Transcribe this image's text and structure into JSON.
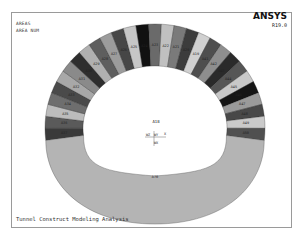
{
  "header": {
    "line1": "AREAS",
    "line2": "AREA NUM"
  },
  "logo": {
    "name": "ANSYS",
    "version": "R19.0"
  },
  "footer": {
    "title": "Tunnel Construct Modeling Analysis"
  },
  "plot": {
    "center_label": "A18",
    "triad": {
      "z": "WZ",
      "y": "WY",
      "x": "X",
      "wx": "WX"
    },
    "invert_label": "A70",
    "segments": [
      {
        "label": "A37",
        "color": "#3a3a3a"
      },
      {
        "label": "A36",
        "color": "#5a5a5a"
      },
      {
        "label": "A35",
        "color": "#bcbcbc"
      },
      {
        "label": "A34",
        "color": "#6e6e6e"
      },
      {
        "label": "A33",
        "color": "#4a4a4a"
      },
      {
        "label": "A32",
        "color": "#a8a8a8"
      },
      {
        "label": "A31",
        "color": "#8a8a8a"
      },
      {
        "label": "A30",
        "color": "#2e2e2e"
      },
      {
        "label": "A29",
        "color": "#b0b0b0"
      },
      {
        "label": "A28",
        "color": "#5e5e5e"
      },
      {
        "label": "A27",
        "color": "#9c9c9c"
      },
      {
        "label": "A26",
        "color": "#464646"
      },
      {
        "label": "A25",
        "color": "#c6c6c6"
      },
      {
        "label": "A24",
        "color": "#111111"
      },
      {
        "label": "A23",
        "color": "#6a6a6a"
      },
      {
        "label": "A22",
        "color": "#c0c0c0"
      },
      {
        "label": "A21",
        "color": "#7a7a7a"
      },
      {
        "label": "A20",
        "color": "#3c3c3c"
      },
      {
        "label": "A19",
        "color": "#d0d0d0"
      },
      {
        "label": "A41",
        "color": "#4e4e4e"
      },
      {
        "label": "A42",
        "color": "#8e8e8e"
      },
      {
        "label": "A43",
        "color": "#2a2a2a"
      },
      {
        "label": "A44",
        "color": "#565656"
      },
      {
        "label": "A45",
        "color": "#c8c8c8"
      },
      {
        "label": "A46",
        "color": "#151515"
      },
      {
        "label": "A47",
        "color": "#9a9a9a"
      },
      {
        "label": "A48",
        "color": "#484848"
      },
      {
        "label": "A49",
        "color": "#cacaca"
      },
      {
        "label": "A50",
        "color": "#505050"
      }
    ],
    "invert_color": "#b4b4b4",
    "outline_color": "#555555"
  }
}
